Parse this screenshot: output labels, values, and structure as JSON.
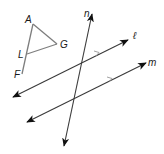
{
  "diagram": {
    "type": "geometry",
    "colors": {
      "lines": "#3a3a3a",
      "triangle": "#7d7d7d",
      "background": "#ffffff"
    },
    "points": {
      "A": {
        "label": "A",
        "x": 33,
        "y": 24
      },
      "G": {
        "label": "G",
        "x": 57,
        "y": 44
      },
      "L": {
        "label": "L",
        "x": 27,
        "y": 54
      },
      "F": {
        "label": "F",
        "x": 22,
        "y": 74
      }
    },
    "lines": {
      "n": {
        "label": "n"
      },
      "l": {
        "label": "ℓ"
      },
      "m": {
        "label": "m"
      }
    },
    "parallel_marks": {
      "lines": [
        "ℓ",
        "m"
      ],
      "count_each": 1
    }
  }
}
